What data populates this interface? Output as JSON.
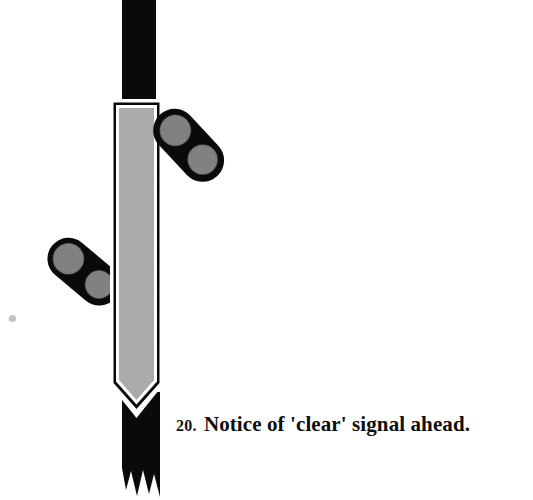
{
  "page": {
    "background_color": "#ffffff",
    "width": 533,
    "height": 500,
    "kind": "scanned-book-illustration"
  },
  "caption": {
    "number": "20.",
    "text": "Notice of 'clear' signal ahead.",
    "full": "20. Notice of 'clear' signal ahead.",
    "color": "#0d0d0d"
  },
  "figure": {
    "colors": {
      "post": "#0a0a0a",
      "arm": "#0a0a0a",
      "plate_fill": "#a9a9a9",
      "plate_outline": "#ffffff",
      "plate_band": "#0a0a0a",
      "lens": "#787878",
      "speck": "#b9b9b9",
      "background": "#ffffff"
    },
    "parts": [
      {
        "name": "signal-post",
        "label": "Signal post"
      },
      {
        "name": "signal-plate",
        "label": "Backing plate"
      },
      {
        "name": "upper-semaphore-arm",
        "label": "Upper semaphore arm"
      },
      {
        "name": "lower-semaphore-arm",
        "label": "Lower semaphore arm"
      },
      {
        "name": "post-frayed-base",
        "label": "Frayed post base"
      }
    ],
    "lamp_count": 4
  }
}
